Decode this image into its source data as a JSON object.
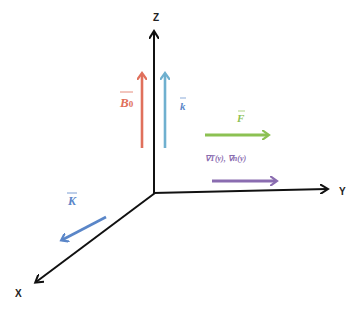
{
  "diagram": {
    "type": "3d-coordinate-vector-diagram",
    "axes": [
      {
        "id": "z",
        "label": "Z"
      },
      {
        "id": "y",
        "label": "Y"
      },
      {
        "id": "x",
        "label": "X"
      }
    ],
    "vectors": [
      {
        "id": "b0",
        "label": "B",
        "subscript": "0",
        "color": "#e0705c",
        "direction": "+z"
      },
      {
        "id": "k_small",
        "label": "k",
        "color": "#6fb0cf",
        "direction": "+z"
      },
      {
        "id": "F",
        "label": "F",
        "color": "#8cc152",
        "direction": "+y"
      },
      {
        "id": "gradients",
        "label": "∇T(y), ∇n(y)",
        "color": "#8a6cb0",
        "direction": "+y"
      },
      {
        "id": "K",
        "label": "K",
        "color": "#5a86c8",
        "direction": "+x"
      }
    ],
    "colors": {
      "axis": "#111111",
      "background": "#ffffff"
    }
  }
}
